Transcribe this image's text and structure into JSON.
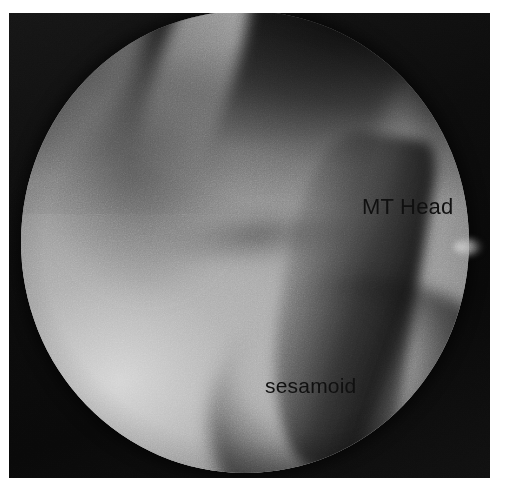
{
  "figure": {
    "kind": "arthroscopic-photograph",
    "modality": "arthroscopy",
    "view_shape": "circular-field-of-view",
    "page_background": "#ffffff",
    "photo_background": "#0b0b0b",
    "field_tone_mid": "#8e8e8e",
    "field_tone_bright": "#c8c8c8",
    "field_tone_dark": "#2a2a2a",
    "label_color": "#101010"
  },
  "annotations": [
    {
      "id": "mt-head",
      "text": "MT Head",
      "x": 353,
      "y": 183,
      "font_size": 22
    },
    {
      "id": "sesamoid",
      "text": "sesamoid",
      "x": 256,
      "y": 362,
      "font_size": 21
    }
  ],
  "structures": {
    "metatarsal_head": "MT Head",
    "sesamoid_bone": "sesamoid"
  }
}
